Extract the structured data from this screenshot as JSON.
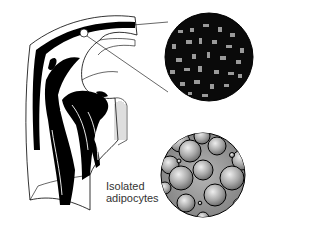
{
  "figure": {
    "top_inset": {
      "name": "tissue-section-magnified",
      "description": "dark tissue section with grey fat islands"
    },
    "bottom_inset": {
      "name": "isolated-adipocytes-magnified",
      "description": "spherical adipocytes"
    },
    "label": {
      "line1": "Isolated",
      "line2": "adipocytes"
    },
    "colors": {
      "ink": "#000000",
      "paper": "#ffffff",
      "cell_fill": "#9a9a9a",
      "cell_highlight": "#e6e6e6",
      "text": "#333333"
    }
  }
}
